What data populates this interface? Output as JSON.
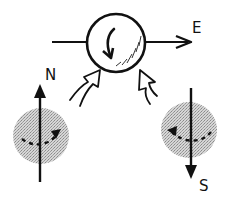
{
  "diagram": {
    "type": "physics-sketch",
    "labels": {
      "east": "E",
      "north": "N",
      "south": "S"
    },
    "center_sphere": {
      "fill": "#ffffff",
      "stroke": "#111111",
      "rotation": "clockwise"
    },
    "side_spheres": [
      {
        "position": "left",
        "fill": "#bdbdbd",
        "axis_direction": "N",
        "rotation_arrow": "right"
      },
      {
        "position": "right",
        "fill": "#bdbdbd",
        "axis_direction": "S",
        "rotation_arrow": "left"
      }
    ],
    "colors": {
      "ink": "#111111",
      "shade": "#bdbdbd",
      "background": "#ffffff"
    }
  }
}
